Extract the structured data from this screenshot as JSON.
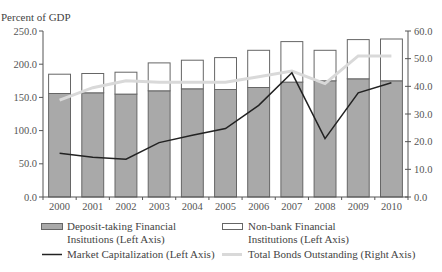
{
  "chart_data": {
    "type": "bar",
    "subtype": "stacked bar with line overlays (dual axis)",
    "title": "",
    "ylabel_left": "Percent of GDP",
    "ylabel_right": "",
    "xlabel": "",
    "categories": [
      "2000",
      "2001",
      "2002",
      "2003",
      "2004",
      "2005",
      "2006",
      "2007",
      "2008",
      "2009",
      "2010"
    ],
    "left_axis": {
      "ylim": [
        0,
        250
      ],
      "ticks": [
        "0.0",
        "50.0",
        "100.0",
        "150.0",
        "200.0",
        "250.0"
      ],
      "tick_values": [
        0,
        50,
        100,
        150,
        200,
        250
      ]
    },
    "right_axis": {
      "ylim": [
        0,
        60
      ],
      "ticks": [
        "0.0",
        "10.0",
        "20.0",
        "30.0",
        "40.0",
        "50.0",
        "60.0"
      ],
      "tick_values": [
        0,
        10,
        20,
        30,
        40,
        50,
        60
      ]
    },
    "grid": false,
    "legend_position": "bottom",
    "series": [
      {
        "name": "Deposit-taking Financial Insitutions (Left Axis)",
        "type": "bar",
        "stack": "total",
        "axis": "left",
        "color": "#a9a9a9",
        "values": [
          156,
          157,
          155,
          160,
          163,
          162,
          165,
          173,
          175,
          178,
          175
        ]
      },
      {
        "name": "Non-bank Financial Institutions (Left Axis)",
        "type": "bar",
        "stack": "total",
        "axis": "left",
        "color": "#ffffff",
        "values": [
          29,
          29,
          33,
          42,
          43,
          48,
          56,
          61,
          46,
          59,
          63
        ]
      },
      {
        "name": "Market Capitalization (Left Axis)",
        "type": "line",
        "axis": "left",
        "color": "#222222",
        "values": [
          66,
          60,
          57,
          82,
          93,
          103,
          138,
          187,
          88,
          157,
          172
        ]
      },
      {
        "name": "Total Bonds Outstanding (Right Axis)",
        "type": "line",
        "axis": "right",
        "color": "#d9d9d9",
        "values": [
          35,
          39.5,
          42,
          41.5,
          41.5,
          41.5,
          43.5,
          45.5,
          41,
          51,
          51
        ]
      }
    ]
  },
  "legend": {
    "items": [
      {
        "line1": "Deposit-taking Financial",
        "line2": "Insitutions (Left Axis)"
      },
      {
        "line1": "Non-bank Financial",
        "line2": "Institutions (Left Axis)"
      },
      {
        "line1": "Market Capitalization (Left Axis)"
      },
      {
        "line1": "Total Bonds Outstanding (Right Axis)"
      }
    ]
  }
}
